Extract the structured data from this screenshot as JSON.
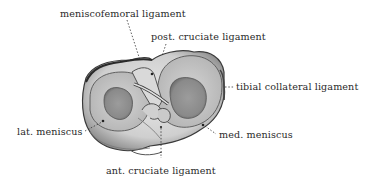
{
  "figure": {
    "labels": [
      {
        "id": "meniscofemoral",
        "text": "meniscofemoral ligament",
        "x": 60,
        "y": 9
      },
      {
        "id": "post_cruciate",
        "text": "post. cruciate ligament",
        "x": 151,
        "y": 32
      },
      {
        "id": "tibial_collateral",
        "text": "tibial collateral ligament",
        "x": 236,
        "y": 82
      },
      {
        "id": "lat_meniscus",
        "text": "lat. meniscus",
        "x": 17,
        "y": 127
      },
      {
        "id": "med_meniscus",
        "text": "med. meniscus",
        "x": 219,
        "y": 130
      },
      {
        "id": "ant_cruciate",
        "text": "ant. cruciate ligament",
        "x": 106,
        "y": 166
      }
    ]
  }
}
